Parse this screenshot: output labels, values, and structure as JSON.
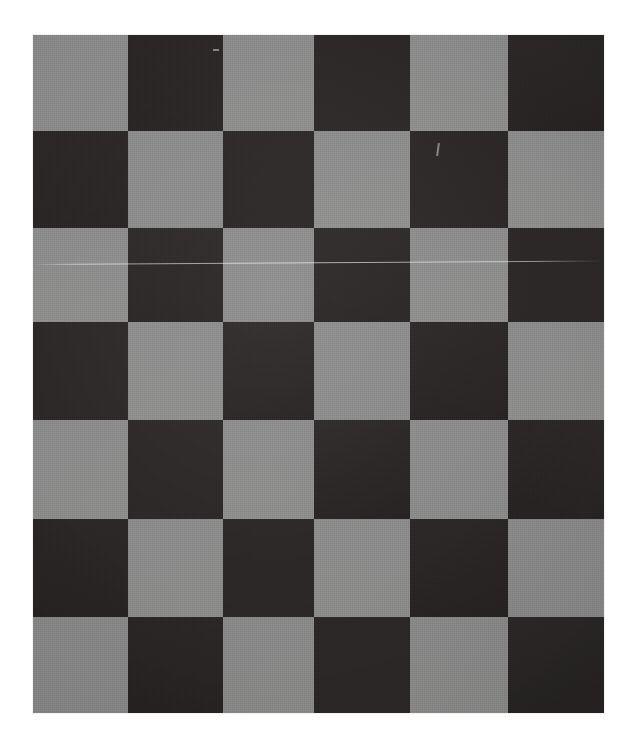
{
  "image": {
    "width": 637,
    "height": 751,
    "background_color": "#ffffff",
    "subject": "checkerboard-pattern-board",
    "alt_text": "Photograph of a checkerboard-pattern cloth board with alternating gray and near-black squares"
  },
  "board": {
    "left": 33,
    "top": 35,
    "width": 571,
    "height": 678,
    "columns": 6,
    "rows": 7,
    "first_square_color": "light",
    "column_edges": [
      0,
      95,
      190,
      281,
      377,
      475,
      571
    ],
    "row_edges": [
      0,
      96,
      193,
      287,
      385,
      484,
      582,
      678
    ],
    "colors": {
      "light": "#8a8a8a",
      "light_alt": "#8d8d8c",
      "dark": "#2b2827",
      "dark_alt": "#262322",
      "background": "#ffffff"
    },
    "pattern": [
      [
        "light",
        "dark",
        "light",
        "dark",
        "light",
        "dark"
      ],
      [
        "dark",
        "light",
        "dark",
        "light",
        "dark",
        "light"
      ],
      [
        "light",
        "dark",
        "light",
        "dark",
        "light",
        "dark"
      ],
      [
        "dark",
        "light",
        "dark",
        "light",
        "dark",
        "light"
      ],
      [
        "light",
        "dark",
        "light",
        "dark",
        "light",
        "dark"
      ],
      [
        "dark",
        "light",
        "dark",
        "light",
        "dark",
        "light"
      ],
      [
        "light",
        "dark",
        "light",
        "dark",
        "light",
        "dark"
      ]
    ]
  },
  "artifacts": {
    "scratches": [
      {
        "name": "horizontal-crease-line",
        "left": 0,
        "top": 229,
        "width": 571,
        "height": 1,
        "rotate": -0.35
      }
    ],
    "nicks": [
      {
        "name": "fiber-mark-upper-right",
        "left": 404,
        "top": 108,
        "width": 2,
        "height": 13,
        "rotate": 8
      },
      {
        "name": "fiber-mark-upper-left",
        "left": 180,
        "top": 14,
        "width": 6,
        "height": 2,
        "rotate": 0
      }
    ]
  }
}
